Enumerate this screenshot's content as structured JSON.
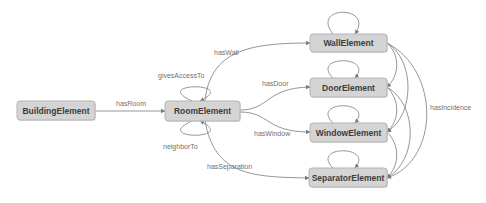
{
  "diagram": {
    "nodes": {
      "building": "BuildingElement",
      "room": "RoomElement",
      "wall": "WallElement",
      "door": "DoorElement",
      "window": "WindowElement",
      "separator": "SeparatorElement"
    },
    "edges": {
      "has_room": "hasRoom",
      "gives_access_to": "givesAccessTo",
      "neighbor_to": "neighborTo",
      "has_wall": "hasWall",
      "has_door": "hasDoor",
      "has_window": "hasWindow",
      "has_separation": "hasSeparation",
      "has_incidence": "hasIncidence"
    },
    "colors": {
      "node_fill": "#d4d4d4",
      "node_border": "#b4b4b4",
      "edge": "#8a8a8a",
      "label": "#707070"
    }
  }
}
